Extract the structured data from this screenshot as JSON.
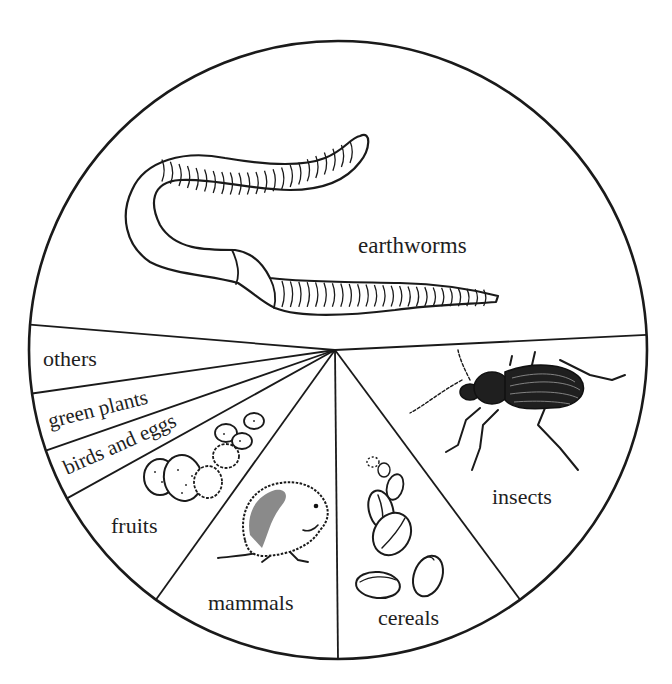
{
  "chart_data": {
    "type": "pie",
    "title": "",
    "start_angle_deg": 274.7,
    "direction": "clockwise",
    "slices": [
      {
        "label": "earthworms",
        "value": 47.9,
        "start": 274.7,
        "end": 447.2
      },
      {
        "label": "insects",
        "value": 15.8,
        "start": 87.2,
        "end": 143.9
      },
      {
        "label": "cereals",
        "value": 10.0,
        "start": 143.9,
        "end": 180.0
      },
      {
        "label": "mammals",
        "value": 10.0,
        "start": 180.0,
        "end": 216.1
      },
      {
        "label": "fruits",
        "value": 7.0,
        "start": 216.1,
        "end": 241.3
      },
      {
        "label": "birds and eggs",
        "value": 2.7,
        "start": 241.3,
        "end": 251.0
      },
      {
        "label": "green plants",
        "value": 3.0,
        "start": 251.0,
        "end": 261.9
      },
      {
        "label": "others",
        "value": 3.6,
        "start": 261.9,
        "end": 274.7
      }
    ],
    "labels": [
      "earthworms",
      "insects",
      "cereals",
      "mammals",
      "fruits",
      "birds and eggs",
      "green plants",
      "others"
    ],
    "values": [
      47.9,
      15.8,
      10.0,
      10.0,
      7.0,
      2.7,
      3.0,
      3.6
    ],
    "legend": "none (labels placed inside slices)",
    "colors": {
      "line": "#1a1a1a",
      "fill": "#ffffff",
      "text": "#1e1e1e"
    }
  },
  "geometry": {
    "cx": 338,
    "cy": 350,
    "r": 309
  },
  "labels": {
    "earthworms": "earthworms",
    "insects": "insects",
    "cereals": "cereals",
    "mammals": "mammals",
    "fruits": "fruits",
    "birds_and_eggs": "birds and eggs",
    "green_plants": "green plants",
    "others": "others"
  },
  "illustrations": [
    "earthworm-icon",
    "beetle-icon",
    "cereal-grain-icon",
    "vole-icon",
    "berries-icon"
  ]
}
